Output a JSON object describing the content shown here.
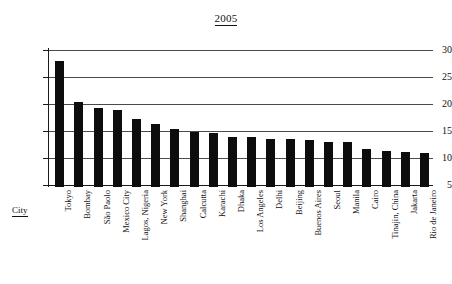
{
  "chart_data": {
    "type": "bar",
    "title": "2005",
    "xlabel": "City",
    "ylabel": "",
    "ylim": [
      5,
      30
    ],
    "yticks": [
      5,
      10,
      15,
      20,
      25,
      30
    ],
    "grid": true,
    "legend": "none",
    "categories": [
      "Tokyo",
      "Bombay",
      "São Paolo",
      "Mexico City",
      "Lagos, Nigeria",
      "New York",
      "Shanghai",
      "Calcutta",
      "Karachi",
      "Dhaka",
      "Los Angeles",
      "Delhi",
      "Beijing",
      "Buenos Aires",
      "Seoul",
      "Manila",
      "Cairo",
      "Tinajin, China",
      "Jakarta",
      "Rio de Janeiro"
    ],
    "values": [
      28.0,
      20.3,
      19.2,
      18.8,
      17.2,
      16.3,
      15.3,
      14.8,
      14.6,
      13.9,
      13.8,
      13.5,
      13.5,
      13.4,
      12.9,
      12.9,
      11.7,
      11.3,
      11.1,
      10.9
    ],
    "bar_color": "#0d0d0d",
    "grid_color": "#4a4a4a",
    "axis_color": "#1a1a1a"
  }
}
